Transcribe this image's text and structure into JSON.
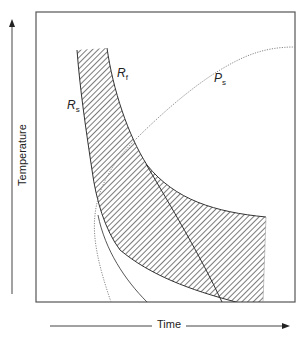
{
  "diagram": {
    "axes": {
      "x_label": "Time",
      "y_label": "Temperature"
    },
    "curves": [
      {
        "id": "Rf",
        "base": "R",
        "sub": "f",
        "style": "solid"
      },
      {
        "id": "Rs",
        "base": "R",
        "sub": "s",
        "style": "solid"
      },
      {
        "id": "Ps",
        "base": "P",
        "sub": "s",
        "style": "dotted"
      }
    ],
    "regions": [
      {
        "name": "hatched-band",
        "fill": "diagonal-hatch"
      }
    ],
    "colors": {
      "frame": "#555555",
      "line": "#333333",
      "dotted": "#888888",
      "hatch": "#333333"
    }
  }
}
